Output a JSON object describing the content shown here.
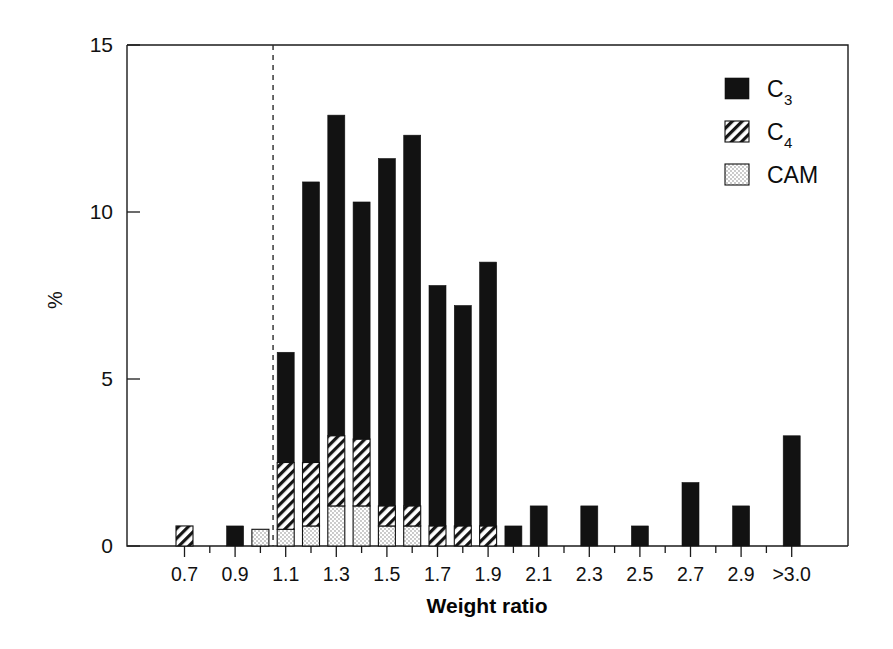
{
  "chart_data": {
    "type": "bar",
    "title": "",
    "subtitle": "",
    "xlabel": "Weight ratio",
    "ylabel": "%",
    "stacked": true,
    "grid": false,
    "legend_position": "top-right",
    "xlim_categories_note": "26 bins, centered on tick marks from 0.7 to >3.0 in 0.1 steps",
    "ylim": [
      0,
      15
    ],
    "yticks": [
      0,
      5,
      10,
      15
    ],
    "ytick_labels": [
      "0",
      "5",
      "10",
      "15"
    ],
    "categories": [
      "0.7",
      "0.8",
      "0.9",
      "1.0",
      "1.1",
      "1.2",
      "1.3",
      "1.4",
      "1.5",
      "1.6",
      "1.7",
      "1.8",
      "1.9",
      "2.0",
      "2.1",
      "2.2",
      "2.3",
      "2.4",
      "2.5",
      "2.6",
      "2.7",
      "2.8",
      "2.9",
      "3.0",
      ">3.0"
    ],
    "xtick_labels_shown": [
      "0.7",
      "0.9",
      "1.1",
      "1.3",
      "1.5",
      "1.7",
      "1.9",
      "2.1",
      "2.3",
      "2.5",
      "2.7",
      "2.9",
      ">3.0"
    ],
    "xtick_labeled_indices": [
      0,
      2,
      4,
      6,
      8,
      10,
      12,
      14,
      16,
      18,
      20,
      22,
      24
    ],
    "annotations": [
      {
        "type": "vline",
        "x_category_index": 3.5,
        "style": "dashed",
        "label": "weight ratio = 1.0"
      }
    ],
    "series": [
      {
        "name": "C3",
        "pattern": "solid-black",
        "color": "#111111",
        "values": [
          0.0,
          0.0,
          0.6,
          0.0,
          3.3,
          8.4,
          9.6,
          7.1,
          10.4,
          11.1,
          7.2,
          6.6,
          7.9,
          0.6,
          1.2,
          0.0,
          1.2,
          0.0,
          0.6,
          0.0,
          1.9,
          0.0,
          1.2,
          0.0,
          3.3
        ]
      },
      {
        "name": "C4",
        "pattern": "diagonal-hatch",
        "color": "#ffffff",
        "values": [
          0.6,
          0.0,
          0.0,
          0.0,
          2.0,
          1.9,
          2.1,
          2.0,
          0.6,
          0.6,
          0.6,
          0.6,
          0.6,
          0.0,
          0.0,
          0.0,
          0.0,
          0.0,
          0.0,
          0.0,
          0.0,
          0.0,
          0.0,
          0.0,
          0.0
        ]
      },
      {
        "name": "CAM",
        "pattern": "dotted-light",
        "color": "#f2f2f2",
        "values": [
          0.0,
          0.0,
          0.0,
          0.5,
          0.5,
          0.6,
          1.2,
          1.2,
          0.6,
          0.6,
          0.0,
          0.0,
          0.0,
          0.0,
          0.0,
          0.0,
          0.0,
          0.0,
          0.0,
          0.0,
          0.0,
          0.0,
          0.0,
          0.0,
          0.0
        ]
      }
    ],
    "totals": [
      0.6,
      0.0,
      0.6,
      0.5,
      5.8,
      10.9,
      13.5,
      10.3,
      11.6,
      12.3,
      7.8,
      7.2,
      8.5,
      0.6,
      1.2,
      0.0,
      1.2,
      0.0,
      0.6,
      0.0,
      1.9,
      0.0,
      1.2,
      0.0,
      3.3
    ]
  },
  "legend": {
    "entries": [
      {
        "label": "C",
        "sub": "3",
        "swatch": "solid-black"
      },
      {
        "label": "C",
        "sub": "4",
        "swatch": "diagonal-hatch"
      },
      {
        "label": "CAM",
        "sub": "",
        "swatch": "dotted-light"
      }
    ]
  },
  "axes": {
    "x_title": "Weight ratio",
    "y_title": "%"
  }
}
